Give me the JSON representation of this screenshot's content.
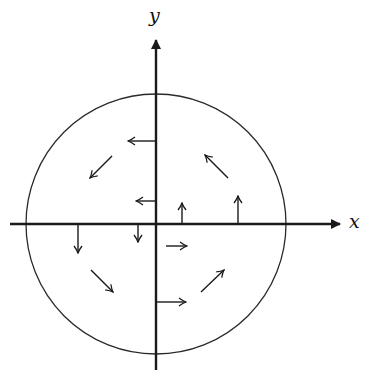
{
  "diagram": {
    "title": "",
    "type": "vector field (rotational) inside a circle",
    "colors": {
      "ink": "#1a1a1a",
      "background": "#ffffff"
    },
    "axes": {
      "x_label": "x",
      "y_label": "y",
      "origin_px": [
        156,
        224
      ]
    },
    "circle": {
      "center_px": [
        156,
        224
      ],
      "radius_px": 130
    },
    "arrows": [
      {
        "id": "pos-y-far",
        "from": [
          156,
          141
        ],
        "to": [
          128,
          141
        ],
        "direction": "left"
      },
      {
        "id": "pos-y-near",
        "from": [
          156,
          201
        ],
        "to": [
          136,
          201
        ],
        "direction": "left"
      },
      {
        "id": "pos-x-near",
        "from": [
          182,
          224
        ],
        "to": [
          182,
          203
        ],
        "direction": "up"
      },
      {
        "id": "pos-x-far",
        "from": [
          238,
          224
        ],
        "to": [
          238,
          196
        ],
        "direction": "up"
      },
      {
        "id": "neg-x-far",
        "from": [
          78,
          224
        ],
        "to": [
          78,
          253
        ],
        "direction": "down"
      },
      {
        "id": "neg-x-near",
        "from": [
          138,
          224
        ],
        "to": [
          138,
          242
        ],
        "direction": "down"
      },
      {
        "id": "neg-y-near",
        "from": [
          166,
          246
        ],
        "to": [
          187,
          246
        ],
        "direction": "right"
      },
      {
        "id": "neg-y-far",
        "from": [
          156,
          302
        ],
        "to": [
          186,
          302
        ],
        "direction": "right"
      },
      {
        "id": "quad2-diag",
        "from": [
          112,
          156
        ],
        "to": [
          90,
          178
        ],
        "direction": "down-left"
      },
      {
        "id": "quad1-diag",
        "from": [
          228,
          178
        ],
        "to": [
          205,
          155
        ],
        "direction": "up-left"
      },
      {
        "id": "quad3-diag",
        "from": [
          91,
          270
        ],
        "to": [
          113,
          292
        ],
        "direction": "down-right"
      },
      {
        "id": "quad4-diag",
        "from": [
          201,
          292
        ],
        "to": [
          224,
          270
        ],
        "direction": "up-right"
      }
    ]
  }
}
